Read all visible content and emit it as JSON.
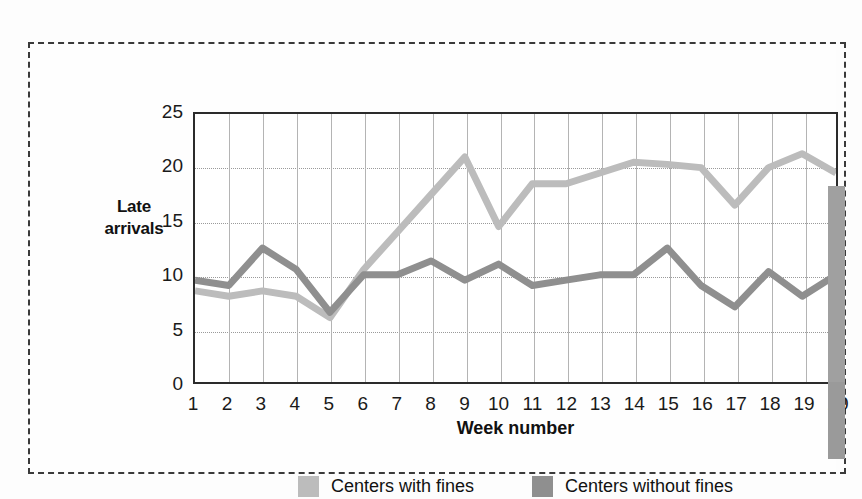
{
  "chart_data": {
    "type": "line",
    "title": "",
    "xlabel": "Week number",
    "ylabel": "Late arrivals",
    "x": [
      1,
      2,
      3,
      4,
      5,
      6,
      7,
      8,
      9,
      10,
      11,
      12,
      13,
      14,
      15,
      16,
      17,
      18,
      19,
      20
    ],
    "xtick_labels": [
      "1",
      "2",
      "3",
      "4",
      "5",
      "6",
      "7",
      "8",
      "9",
      "10",
      "11",
      "12",
      "13",
      "14",
      "15",
      "16",
      "17",
      "18",
      "19",
      "20"
    ],
    "ytick_labels": [
      "0",
      "5",
      "10",
      "15",
      "20",
      "25"
    ],
    "yticks": [
      0,
      5,
      10,
      15,
      20,
      25
    ],
    "ylim": [
      0,
      25
    ],
    "xlim": [
      1,
      20
    ],
    "grid": true,
    "legend_position": "bottom",
    "series": [
      {
        "name": "Centers with fines",
        "color": "#bcbcbc",
        "values": [
          8.5,
          8.0,
          8.5,
          8.0,
          6.0,
          10.5,
          14.0,
          17.5,
          21.0,
          14.5,
          18.5,
          18.5,
          19.5,
          20.5,
          20.3,
          20.0,
          16.5,
          20.0,
          21.3,
          19.5
        ]
      },
      {
        "name": "Centers without fines",
        "color": "#8f8f8f",
        "values": [
          9.5,
          9.0,
          12.5,
          10.5,
          6.5,
          10.0,
          10.0,
          11.3,
          9.5,
          11.0,
          9.0,
          9.5,
          10.0,
          10.0,
          12.5,
          9.0,
          7.0,
          10.3,
          8.0,
          10.0
        ]
      }
    ]
  },
  "axes": {
    "y_title": "Late\narrivals",
    "y_title_line1": "Late",
    "y_title_line2": "arrivals",
    "x_title": "Week number"
  },
  "legend": {
    "items": [
      {
        "label": "Centers with fines",
        "color": "#bcbcbc"
      },
      {
        "label": "Centers without fines",
        "color": "#8f8f8f"
      }
    ]
  },
  "colors": {
    "with_fines": "#bcbcbc",
    "without_fines": "#8f8f8f",
    "axis": "#2b2b2b",
    "grid_minor": "#9a9a9a",
    "grid_major": "#b4b4b4",
    "crop_frame": "#3a3a3a",
    "scrollbar": "#a0a0a0"
  }
}
